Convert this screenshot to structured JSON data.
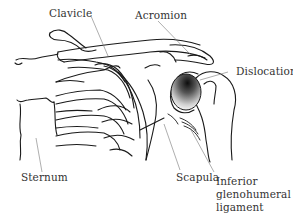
{
  "diagram": {
    "labels": {
      "clavicle": "Clavicle",
      "acromion": "Acromion",
      "dislocation": "Dislocation",
      "sternum": "Sternum",
      "scapula": "Scapula",
      "inferior_glenohumeral_ligament_line1": "Inferior",
      "inferior_glenohumeral_ligament_line2": "glenohumeral",
      "inferior_glenohumeral_ligament_line3": "ligament"
    },
    "colors": {
      "outline": "#1a1a1a",
      "leader": "#777777",
      "text": "#333333",
      "shading_dark": "#111111"
    }
  }
}
